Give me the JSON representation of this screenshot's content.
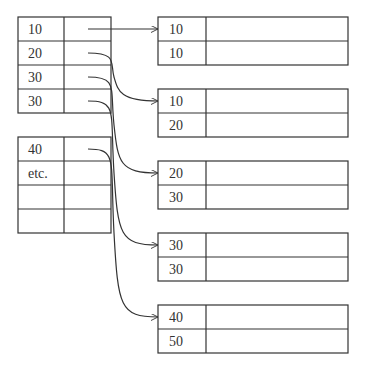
{
  "index_tables": [
    {
      "x": 18,
      "y": 17,
      "rows": [
        "10",
        "20",
        "30",
        "30"
      ]
    },
    {
      "x": 18,
      "y": 137,
      "rows": [
        "40",
        "etc.",
        "",
        ""
      ]
    }
  ],
  "index_layout": {
    "width": 93,
    "key_col_width": 46,
    "row_height": 24
  },
  "data_blocks": [
    {
      "y": 17,
      "rows": [
        "10",
        "10"
      ]
    },
    {
      "y": 89,
      "rows": [
        "10",
        "20"
      ]
    },
    {
      "y": 161,
      "rows": [
        "20",
        "30"
      ]
    },
    {
      "y": 233,
      "rows": [
        "30",
        "30"
      ]
    },
    {
      "y": 305,
      "rows": [
        "40",
        "50"
      ]
    }
  ],
  "block_layout": {
    "x": 158,
    "width": 190,
    "key_col_width": 48,
    "row_height": 24
  },
  "pointers": [
    {
      "from_table": 0,
      "from_row": 0,
      "to_block": 0
    },
    {
      "from_table": 0,
      "from_row": 1,
      "to_block": 1
    },
    {
      "from_table": 0,
      "from_row": 2,
      "to_block": 2
    },
    {
      "from_table": 0,
      "from_row": 3,
      "to_block": 3
    },
    {
      "from_table": 1,
      "from_row": 0,
      "to_block": 4
    }
  ],
  "colors": {
    "line": "#333333",
    "background": "#ffffff"
  }
}
